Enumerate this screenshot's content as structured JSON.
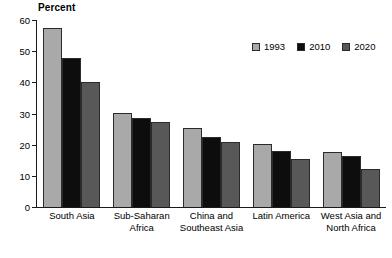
{
  "chart_data": {
    "type": "bar",
    "title": "",
    "ylabel": "Percent",
    "xlabel": "",
    "ylim": [
      0,
      60
    ],
    "yticks": [
      0,
      10,
      20,
      30,
      40,
      50,
      60
    ],
    "grid": false,
    "legend_position": "top-right",
    "categories": [
      "South Asia",
      "Sub-Saharan Africa",
      "China and Southeast Asia",
      "Latin America",
      "West Asia and North Africa"
    ],
    "category_lines": [
      [
        "South Asia",
        ""
      ],
      [
        "Sub-Saharan",
        "Africa"
      ],
      [
        "China and",
        "Southeast Asia"
      ],
      [
        "Latin America",
        ""
      ],
      [
        "West Asia and",
        "North Africa"
      ]
    ],
    "series": [
      {
        "name": "1993",
        "color": "#a9a9a9",
        "values": [
          57.5,
          30.3,
          25.2,
          20.3,
          17.7
        ]
      },
      {
        "name": "2010",
        "color": "#0d0d0d",
        "values": [
          47.7,
          28.6,
          22.6,
          18.0,
          16.4
        ]
      },
      {
        "name": "2020",
        "color": "#585858",
        "values": [
          40.2,
          27.2,
          20.9,
          15.3,
          12.3
        ]
      }
    ]
  },
  "legend": {
    "items": [
      {
        "label": "1993",
        "color": "#a9a9a9"
      },
      {
        "label": "2010",
        "color": "#0d0d0d"
      },
      {
        "label": "2020",
        "color": "#585858"
      }
    ]
  },
  "axis": {
    "y_title": "Percent",
    "y_tick_labels": [
      "60",
      "50",
      "40",
      "30",
      "20",
      "10",
      "0"
    ]
  },
  "caption": {
    "text": ""
  }
}
